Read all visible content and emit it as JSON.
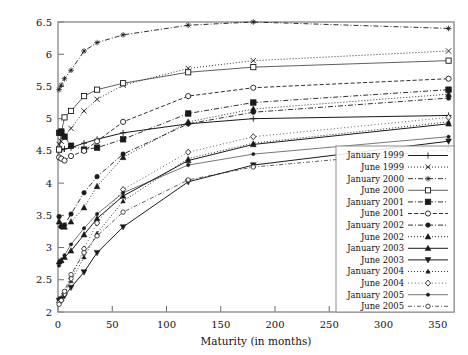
{
  "chart_data": {
    "type": "line",
    "title": "",
    "xlabel": "Maturity (in months)",
    "ylabel": "",
    "xlim": [
      0,
      365
    ],
    "ylim": [
      2,
      6.5
    ],
    "xticks": [
      0,
      50,
      100,
      150,
      200,
      250,
      300,
      350
    ],
    "yticks": [
      2,
      2.5,
      3,
      3.5,
      4,
      4.5,
      5,
      5.5,
      6,
      6.5
    ],
    "grid": false,
    "legend_position": "right-bottom-inside",
    "x": [
      1,
      3,
      6,
      12,
      24,
      36,
      60,
      120,
      180,
      360
    ],
    "series": [
      {
        "name": "January 1999",
        "marker": "plus",
        "dash": "solid",
        "values": [
          4.5,
          4.52,
          4.53,
          4.55,
          4.62,
          4.68,
          4.78,
          4.92,
          5.0,
          5.05
        ]
      },
      {
        "name": "June 1999",
        "marker": "cross",
        "dash": "dotted",
        "values": [
          4.6,
          4.65,
          4.72,
          4.85,
          5.12,
          5.3,
          5.52,
          5.78,
          5.9,
          6.05
        ]
      },
      {
        "name": "January 2000",
        "marker": "star",
        "dash": "dashdot",
        "values": [
          5.45,
          5.52,
          5.62,
          5.75,
          6.05,
          6.18,
          6.3,
          6.45,
          6.5,
          6.4
        ]
      },
      {
        "name": "June 2000",
        "marker": "open-square",
        "dash": "solid-thin",
        "values": [
          4.52,
          4.78,
          5.02,
          5.12,
          5.35,
          5.45,
          5.55,
          5.72,
          5.8,
          5.9
        ]
      },
      {
        "name": "January 2001",
        "marker": "filled-square",
        "dash": "dashdot",
        "values": [
          4.78,
          4.8,
          4.72,
          4.58,
          4.52,
          4.55,
          4.68,
          5.08,
          5.25,
          5.45
        ]
      },
      {
        "name": "June 2001",
        "marker": "open-circle",
        "dash": "dashed",
        "values": [
          4.4,
          4.38,
          4.35,
          4.42,
          4.5,
          4.65,
          4.95,
          5.35,
          5.48,
          5.62
        ]
      },
      {
        "name": "January 2002",
        "marker": "filled-dot",
        "dash": "dashdot",
        "values": [
          3.48,
          3.32,
          3.35,
          3.52,
          3.85,
          4.1,
          4.45,
          4.92,
          5.1,
          5.32
        ]
      },
      {
        "name": "June 2002",
        "marker": "filled-triangle",
        "dash": "dotted",
        "values": [
          3.4,
          3.35,
          3.32,
          3.4,
          3.62,
          3.95,
          4.4,
          4.95,
          5.15,
          5.38
        ]
      },
      {
        "name": "January 2003",
        "marker": "triangle-up",
        "dash": "solid",
        "values": [
          2.78,
          2.8,
          2.85,
          2.95,
          3.2,
          3.45,
          3.8,
          4.35,
          4.6,
          4.92
        ]
      },
      {
        "name": "June 2003",
        "marker": "triangle-down",
        "dash": "solid",
        "values": [
          2.18,
          2.2,
          2.25,
          2.38,
          2.62,
          2.92,
          3.32,
          4.02,
          4.28,
          4.65
        ]
      },
      {
        "name": "January 2004",
        "marker": "small-triangle",
        "dash": "dotted",
        "values": [
          2.2,
          2.22,
          2.3,
          2.48,
          2.85,
          3.22,
          3.72,
          4.38,
          4.62,
          4.95
        ]
      },
      {
        "name": "June 2004",
        "marker": "open-diamond",
        "dash": "dotted-fine",
        "values": [
          2.15,
          2.18,
          2.28,
          2.52,
          2.98,
          3.38,
          3.9,
          4.48,
          4.72,
          5.02
        ]
      },
      {
        "name": "January 2005",
        "marker": "small-dot",
        "dash": "solid-fine",
        "values": [
          2.72,
          2.78,
          2.88,
          3.05,
          3.3,
          3.52,
          3.85,
          4.28,
          4.45,
          4.72
        ]
      },
      {
        "name": "June 2005",
        "marker": "open-dot",
        "dash": "dashdot-fine",
        "values": [
          2.12,
          2.18,
          2.32,
          2.58,
          2.92,
          3.18,
          3.55,
          4.05,
          4.25,
          4.52
        ]
      }
    ]
  },
  "legend": {
    "items": [
      {
        "label": "January 1999"
      },
      {
        "label": "June 1999"
      },
      {
        "label": "January 2000"
      },
      {
        "label": "June 2000"
      },
      {
        "label": "January 2001"
      },
      {
        "label": "June 2001"
      },
      {
        "label": "January 2002"
      },
      {
        "label": "June 2002"
      },
      {
        "label": "January 2003"
      },
      {
        "label": "June 2003"
      },
      {
        "label": "January 2004"
      },
      {
        "label": "June 2004"
      },
      {
        "label": "January 2005"
      },
      {
        "label": "June 2005"
      }
    ]
  },
  "colors": {
    "ink": "#1a1a1a",
    "frame": "#8e8e8e",
    "background": "#ffffff"
  }
}
